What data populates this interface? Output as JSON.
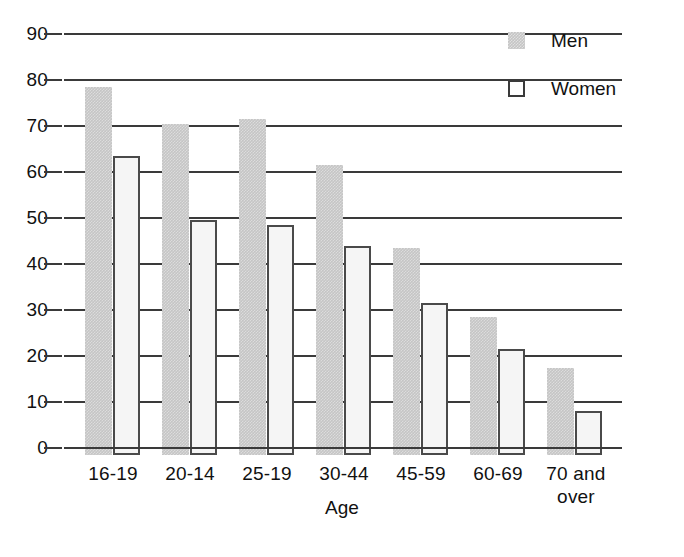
{
  "chart_data": {
    "type": "bar",
    "title": "",
    "xlabel": "Age",
    "ylabel": "",
    "categories": [
      "16-19",
      "20-14",
      "25-19",
      "30-44",
      "45-59",
      "60-69",
      "70 and over"
    ],
    "series": [
      {
        "name": "Men",
        "color": "#c5c5c5",
        "values": [
          80,
          72,
          73,
          63,
          45,
          30,
          19
        ]
      },
      {
        "name": "Women",
        "color": "#f5f5f5",
        "values": [
          65,
          51,
          50,
          45.5,
          33,
          23,
          9.5
        ]
      }
    ],
    "ylim": [
      0,
      90
    ],
    "ytick_labels": [
      "90",
      "80",
      "70",
      "60",
      "50",
      "40",
      "30",
      "20",
      "10",
      "0"
    ],
    "ytick_values": [
      90,
      80,
      70,
      60,
      50,
      40,
      30,
      20,
      10,
      0
    ],
    "grid": true,
    "grid_axis": "y",
    "legend_position": "top-right",
    "legend_entries": [
      "Men",
      "Women"
    ]
  },
  "axis": {
    "x_title": "Age",
    "ticks_y": [
      {
        "label": "90"
      },
      {
        "label": "80"
      },
      {
        "label": "70"
      },
      {
        "label": "60"
      },
      {
        "label": "50"
      },
      {
        "label": "40"
      },
      {
        "label": "30"
      },
      {
        "label": "20"
      },
      {
        "label": "10"
      },
      {
        "label": "0"
      }
    ],
    "ticks_x": [
      {
        "label": "16-19"
      },
      {
        "label": "20-14"
      },
      {
        "label": "25-19"
      },
      {
        "label": "30-44"
      },
      {
        "label": "45-59"
      },
      {
        "label": "60-69"
      },
      {
        "label": "70 and\nover"
      }
    ]
  },
  "legend": {
    "men_label": "Men",
    "women_label": "Women"
  }
}
